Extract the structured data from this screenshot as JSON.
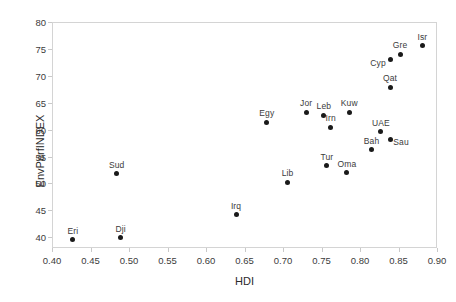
{
  "chart_data": {
    "type": "scatter",
    "title": "",
    "xlabel": "HDI",
    "ylabel": "EnvPerfINDEX",
    "xlim": [
      0.4,
      0.9
    ],
    "ylim": [
      38.0,
      80.0
    ],
    "xticks": [
      "0.40",
      "0.45",
      "0.50",
      "0.55",
      "0.60",
      "0.65",
      "0.70",
      "0.75",
      "0.80",
      "0.85",
      "0.90"
    ],
    "xtick_values": [
      0.4,
      0.45,
      0.5,
      0.55,
      0.6,
      0.65,
      0.7,
      0.75,
      0.8,
      0.85,
      0.9
    ],
    "yticks": [
      "40",
      "45",
      "50",
      "55",
      "60",
      "65",
      "70",
      "75",
      "80"
    ],
    "ytick_values": [
      40,
      45,
      50,
      55,
      60,
      65,
      70,
      75,
      80
    ],
    "grid": false,
    "legend": null,
    "marker_color": "#1a1a1a",
    "points": [
      {
        "label": "Eri",
        "x": 0.427,
        "y": 39.5,
        "label_dx": 0,
        "label_dy": -4
      },
      {
        "label": "Dji",
        "x": 0.489,
        "y": 39.9,
        "label_dx": 0,
        "label_dy": -4
      },
      {
        "label": "Irq",
        "x": 0.639,
        "y": 44.2,
        "label_dx": 0,
        "label_dy": -4
      },
      {
        "label": "Sud",
        "x": 0.484,
        "y": 51.8,
        "label_dx": 0,
        "label_dy": -4
      },
      {
        "label": "Lib",
        "x": 0.706,
        "y": 50.2,
        "label_dx": 0,
        "label_dy": -4
      },
      {
        "label": "Oma",
        "x": 0.783,
        "y": 52.0,
        "label_dx": 0,
        "label_dy": -4
      },
      {
        "label": "Tur",
        "x": 0.757,
        "y": 53.3,
        "label_dx": 0,
        "label_dy": -4
      },
      {
        "label": "Bah",
        "x": 0.815,
        "y": 56.3,
        "label_dx": 0,
        "label_dy": -4
      },
      {
        "label": "Sau",
        "x": 0.839,
        "y": 58.2,
        "label_dx": 11,
        "label_dy": 3
      },
      {
        "label": "UAE",
        "x": 0.827,
        "y": 59.6,
        "label_dx": 0,
        "label_dy": -4
      },
      {
        "label": "Irn",
        "x": 0.762,
        "y": 60.4,
        "label_dx": 0,
        "label_dy": -4
      },
      {
        "label": "Leb",
        "x": 0.753,
        "y": 62.7,
        "label_dx": 0,
        "label_dy": -4
      },
      {
        "label": "Jor",
        "x": 0.73,
        "y": 63.2,
        "label_dx": 0,
        "label_dy": -4
      },
      {
        "label": "Kuw",
        "x": 0.786,
        "y": 63.2,
        "label_dx": 0,
        "label_dy": -4
      },
      {
        "label": "Egy",
        "x": 0.679,
        "y": 61.4,
        "label_dx": 0,
        "label_dy": -4
      },
      {
        "label": "Qat",
        "x": 0.839,
        "y": 67.9,
        "label_dx": 0,
        "label_dy": -4
      },
      {
        "label": "Cyp",
        "x": 0.839,
        "y": 73.0,
        "label_dx": -12,
        "label_dy": 3
      },
      {
        "label": "Gre",
        "x": 0.852,
        "y": 74.0,
        "label_dx": 0,
        "label_dy": -4
      },
      {
        "label": "Isr",
        "x": 0.881,
        "y": 75.6,
        "label_dx": 0,
        "label_dy": -4
      }
    ]
  }
}
